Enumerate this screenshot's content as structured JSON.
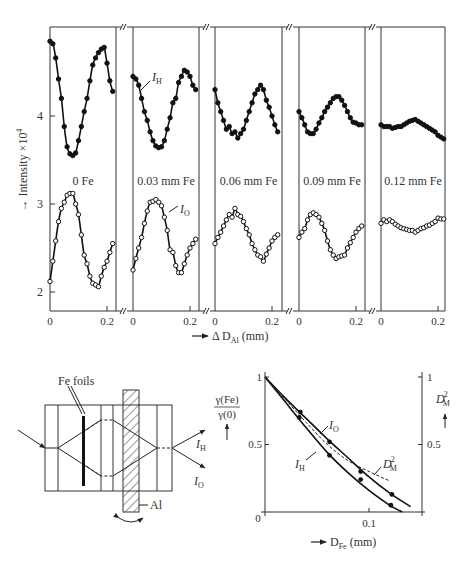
{
  "chart_data": [
    {
      "type": "line",
      "title": "",
      "ylabel": "Intensity ×10⁴",
      "xlabel": "Δ D_Al (mm)",
      "ylim": [
        1.8,
        5.0
      ],
      "yticks": [
        2,
        3,
        4
      ],
      "xticks": [
        0,
        0.2
      ],
      "grid": false,
      "legend": "inline labels I_H and I_O",
      "panels": [
        {
          "label": "0 Fe",
          "I_H": {
            "x": [
              0,
              0.01,
              0.02,
              0.03,
              0.04,
              0.05,
              0.06,
              0.07,
              0.08,
              0.09,
              0.1,
              0.11,
              0.12,
              0.13,
              0.14,
              0.15,
              0.16,
              0.17,
              0.18,
              0.19,
              0.2,
              0.21,
              0.22
            ],
            "y": [
              4.85,
              4.82,
              4.66,
              4.42,
              4.2,
              3.88,
              3.65,
              3.57,
              3.55,
              3.58,
              3.72,
              3.88,
              4.05,
              4.2,
              4.4,
              4.58,
              4.66,
              4.72,
              4.76,
              4.78,
              4.6,
              4.4,
              4.28
            ]
          },
          "I_O": {
            "x": [
              0,
              0.01,
              0.02,
              0.03,
              0.04,
              0.05,
              0.06,
              0.07,
              0.08,
              0.09,
              0.1,
              0.11,
              0.12,
              0.13,
              0.14,
              0.15,
              0.16,
              0.17,
              0.18,
              0.19,
              0.2,
              0.21,
              0.22
            ],
            "y": [
              2.12,
              2.35,
              2.58,
              2.8,
              2.95,
              3.02,
              3.1,
              3.12,
              3.12,
              3.0,
              2.88,
              2.65,
              2.42,
              2.32,
              2.18,
              2.1,
              2.08,
              2.06,
              2.18,
              2.28,
              2.35,
              2.45,
              2.55
            ]
          }
        },
        {
          "label": "0.03 mm Fe",
          "I_H": {
            "x": [
              0,
              0.01,
              0.02,
              0.03,
              0.04,
              0.05,
              0.06,
              0.07,
              0.08,
              0.09,
              0.1,
              0.11,
              0.12,
              0.13,
              0.14,
              0.15,
              0.16,
              0.17,
              0.18,
              0.19,
              0.2,
              0.21,
              0.22
            ],
            "y": [
              4.45,
              4.42,
              4.35,
              4.2,
              4.05,
              3.95,
              3.82,
              3.72,
              3.66,
              3.64,
              3.65,
              3.72,
              3.85,
              3.98,
              4.15,
              4.2,
              4.38,
              4.45,
              4.52,
              4.5,
              4.45,
              4.35,
              4.3
            ]
          },
          "I_O": {
            "x": [
              0,
              0.01,
              0.02,
              0.03,
              0.04,
              0.05,
              0.06,
              0.07,
              0.08,
              0.09,
              0.1,
              0.11,
              0.12,
              0.13,
              0.14,
              0.15,
              0.16,
              0.17,
              0.18,
              0.19,
              0.2,
              0.21,
              0.22
            ],
            "y": [
              2.25,
              2.38,
              2.5,
              2.62,
              2.78,
              2.92,
              3.02,
              3.03,
              3.05,
              3.02,
              2.98,
              2.85,
              2.7,
              2.48,
              2.45,
              2.3,
              2.22,
              2.22,
              2.32,
              2.42,
              2.5,
              2.55,
              2.6
            ]
          }
        },
        {
          "label": "0.06 mm Fe",
          "I_H": {
            "x": [
              0,
              0.01,
              0.02,
              0.03,
              0.04,
              0.05,
              0.06,
              0.07,
              0.08,
              0.09,
              0.1,
              0.11,
              0.12,
              0.13,
              0.14,
              0.15,
              0.16,
              0.17,
              0.18,
              0.19,
              0.2,
              0.21,
              0.22
            ],
            "y": [
              4.3,
              4.15,
              4.05,
              3.95,
              3.85,
              3.88,
              3.8,
              3.82,
              3.75,
              3.8,
              3.85,
              3.95,
              4.05,
              4.15,
              4.25,
              4.3,
              4.35,
              4.3,
              4.18,
              4.1,
              4.0,
              3.9,
              3.82
            ]
          },
          "I_O": {
            "x": [
              0,
              0.01,
              0.02,
              0.03,
              0.04,
              0.05,
              0.06,
              0.07,
              0.08,
              0.09,
              0.1,
              0.11,
              0.12,
              0.13,
              0.14,
              0.15,
              0.16,
              0.17,
              0.18,
              0.19,
              0.2,
              0.21,
              0.22
            ],
            "y": [
              2.55,
              2.62,
              2.68,
              2.75,
              2.82,
              2.88,
              2.85,
              2.95,
              2.88,
              2.86,
              2.8,
              2.72,
              2.65,
              2.55,
              2.48,
              2.42,
              2.4,
              2.35,
              2.43,
              2.5,
              2.58,
              2.62,
              2.65
            ]
          }
        },
        {
          "label": "0.09 mm Fe",
          "I_H": {
            "x": [
              0,
              0.01,
              0.02,
              0.03,
              0.04,
              0.05,
              0.06,
              0.07,
              0.08,
              0.09,
              0.1,
              0.11,
              0.12,
              0.13,
              0.14,
              0.15,
              0.16,
              0.17,
              0.18,
              0.19,
              0.2,
              0.21,
              0.22
            ],
            "y": [
              4.05,
              3.98,
              3.9,
              3.82,
              3.8,
              3.8,
              3.85,
              3.92,
              3.98,
              4.05,
              4.1,
              4.15,
              4.2,
              4.22,
              4.22,
              4.18,
              4.12,
              4.05,
              3.98,
              3.93,
              3.92,
              3.9,
              3.9
            ]
          },
          "I_O": {
            "x": [
              0,
              0.01,
              0.02,
              0.03,
              0.04,
              0.05,
              0.06,
              0.07,
              0.08,
              0.09,
              0.1,
              0.11,
              0.12,
              0.13,
              0.14,
              0.15,
              0.16,
              0.17,
              0.18,
              0.19,
              0.2,
              0.21,
              0.22
            ],
            "y": [
              2.62,
              2.68,
              2.72,
              2.82,
              2.88,
              2.9,
              2.88,
              2.85,
              2.78,
              2.7,
              2.58,
              2.48,
              2.42,
              2.38,
              2.4,
              2.41,
              2.42,
              2.5,
              2.56,
              2.62,
              2.68,
              2.72,
              2.75
            ]
          }
        },
        {
          "label": "0.12 mm Fe",
          "I_H": {
            "x": [
              0,
              0.01,
              0.02,
              0.03,
              0.04,
              0.05,
              0.06,
              0.07,
              0.08,
              0.09,
              0.1,
              0.11,
              0.12,
              0.13,
              0.14,
              0.15,
              0.16,
              0.17,
              0.18,
              0.19,
              0.2,
              0.21,
              0.22
            ],
            "y": [
              3.9,
              3.88,
              3.88,
              3.88,
              3.86,
              3.87,
              3.88,
              3.88,
              3.9,
              3.92,
              3.94,
              3.95,
              3.96,
              3.94,
              3.92,
              3.9,
              3.88,
              3.86,
              3.84,
              3.82,
              3.78,
              3.76,
              3.74
            ]
          },
          "I_O": {
            "x": [
              0,
              0.01,
              0.02,
              0.03,
              0.04,
              0.05,
              0.06,
              0.07,
              0.08,
              0.09,
              0.1,
              0.11,
              0.12,
              0.13,
              0.14,
              0.15,
              0.16,
              0.17,
              0.18,
              0.19,
              0.2,
              0.21,
              0.22
            ],
            "y": [
              2.78,
              2.82,
              2.8,
              2.82,
              2.8,
              2.77,
              2.75,
              2.73,
              2.72,
              2.71,
              2.7,
              2.7,
              2.68,
              2.7,
              2.72,
              2.73,
              2.75,
              2.76,
              2.78,
              2.8,
              2.84,
              2.83,
              2.83
            ]
          }
        }
      ]
    },
    {
      "type": "line",
      "title": "",
      "xlabel": "D_Fe (mm)",
      "ylabel": "γ(Fe)/γ(0)",
      "ylabel_right": "D_M²",
      "xlim": [
        0,
        0.15
      ],
      "ylim": [
        0,
        1
      ],
      "xticks": [
        0,
        0.1
      ],
      "yticks": [
        0.5,
        1
      ],
      "yticks_right": [
        0.5,
        1
      ],
      "grid": false,
      "series": [
        {
          "name": "I_O",
          "style": "solid",
          "points_x": [
            0.034,
            0.062,
            0.092,
            0.122
          ],
          "points_y": [
            0.74,
            0.52,
            0.3,
            0.13
          ],
          "curve_x": [
            0,
            0.02,
            0.04,
            0.06,
            0.08,
            0.1,
            0.12,
            0.14
          ],
          "curve_y": [
            1,
            0.84,
            0.69,
            0.54,
            0.4,
            0.26,
            0.14,
            0.04
          ]
        },
        {
          "name": "I_H",
          "style": "solid",
          "points_x": [
            0.033,
            0.062,
            0.092,
            0.121
          ],
          "points_y": [
            0.7,
            0.42,
            0.24,
            0.05
          ],
          "curve_x": [
            0,
            0.02,
            0.04,
            0.06,
            0.08,
            0.1,
            0.12,
            0.132
          ],
          "curve_y": [
            1,
            0.81,
            0.62,
            0.44,
            0.29,
            0.16,
            0.05,
            0.0
          ]
        },
        {
          "name": "D_M²",
          "style": "dashed",
          "curve_x": [
            0,
            0.02,
            0.04,
            0.06,
            0.08,
            0.1,
            0.12
          ],
          "curve_y": [
            1,
            0.83,
            0.66,
            0.5,
            0.38,
            0.3,
            0.23
          ]
        }
      ]
    }
  ],
  "labels": {
    "y_axis_top": "Intensity ×10",
    "y_axis_top_exp": "4",
    "x_axis_top": "Δ D",
    "x_axis_top_sub": "Al",
    "x_axis_top_unit": "(mm)",
    "ih": "I",
    "ih_sub": "H",
    "io": "I",
    "io_sub": "O",
    "tick_2": "2",
    "tick_3": "3",
    "tick_4": "4",
    "tick_0": "0",
    "tick_02": "0.2",
    "fe_foils": "Fe foils",
    "al": "Al",
    "gamma_num": "γ(Fe)",
    "gamma_den": "γ(0)",
    "dm": "D",
    "dm_sub": "M",
    "dm_sup": "2",
    "tick_1": "1",
    "tick_05": "0.5",
    "tick_01": "0.1",
    "x_axis_bottom": "D",
    "x_axis_bottom_sub": "Fe",
    "x_axis_bottom_unit": "(mm)",
    "arrow": "→"
  }
}
